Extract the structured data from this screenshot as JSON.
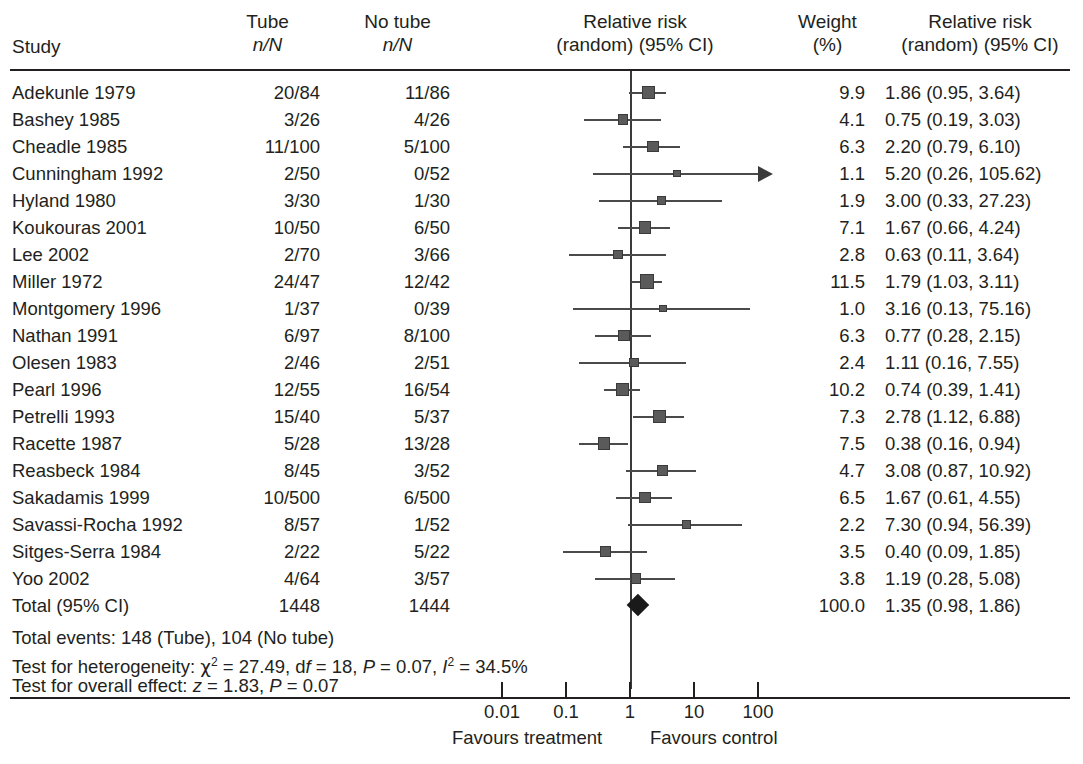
{
  "header": {
    "study_label": "Study",
    "tube": {
      "line1": "Tube",
      "line2": "n/N"
    },
    "no_tube": {
      "line1": "No tube",
      "line2": "n/N"
    },
    "plot": {
      "line1": "Relative risk",
      "line2": "(random) (95% CI)"
    },
    "weight": {
      "line1": "Weight",
      "line2": "(%)"
    },
    "rr": {
      "line1": "Relative risk",
      "line2": "(random) (95% CI)"
    }
  },
  "chart_data": {
    "type": "forest",
    "title": "Relative risk (random) (95% CI)",
    "xlabel": "",
    "ylabel": "",
    "xscale": "log",
    "xlim": [
      0.01,
      100
    ],
    "xticks": [
      "0.01",
      "0.1",
      "1",
      "10",
      "100"
    ],
    "xtick_values": [
      0.01,
      0.1,
      1,
      10,
      100
    ],
    "null_line": 1,
    "favours_left": "Favours treatment",
    "favours_right": "Favours control",
    "grid": false,
    "columns": [
      "Study",
      "Tube n/N",
      "No tube n/N",
      "Weight (%)",
      "Relative risk (random) (95% CI)"
    ],
    "rows": [
      {
        "study": "Adekunle 1979",
        "tube": "20/84",
        "no_tube": "11/86",
        "weight": "9.9",
        "weight_value": 9.9,
        "rr_text": "1.86 (0.95, 3.64)",
        "rr": 1.86,
        "lo": 0.95,
        "hi": 3.64,
        "arrow": false
      },
      {
        "study": "Bashey 1985",
        "tube": "3/26",
        "no_tube": "4/26",
        "weight": "4.1",
        "weight_value": 4.1,
        "rr_text": "0.75 (0.19, 3.03)",
        "rr": 0.75,
        "lo": 0.19,
        "hi": 3.03,
        "arrow": false
      },
      {
        "study": "Cheadle 1985",
        "tube": "11/100",
        "no_tube": "5/100",
        "weight": "6.3",
        "weight_value": 6.3,
        "rr_text": "2.20 (0.79, 6.10)",
        "rr": 2.2,
        "lo": 0.79,
        "hi": 6.1,
        "arrow": false
      },
      {
        "study": "Cunningham 1992",
        "tube": "2/50",
        "no_tube": "0/52",
        "weight": "1.1",
        "weight_value": 1.1,
        "rr_text": "5.20 (0.26, 105.62)",
        "rr": 5.2,
        "lo": 0.26,
        "hi": 105.62,
        "arrow": true
      },
      {
        "study": "Hyland 1980",
        "tube": "3/30",
        "no_tube": "1/30",
        "weight": "1.9",
        "weight_value": 1.9,
        "rr_text": "3.00 (0.33, 27.23)",
        "rr": 3.0,
        "lo": 0.33,
        "hi": 27.23,
        "arrow": false
      },
      {
        "study": "Koukouras 2001",
        "tube": "10/50",
        "no_tube": "6/50",
        "weight": "7.1",
        "weight_value": 7.1,
        "rr_text": "1.67 (0.66, 4.24)",
        "rr": 1.67,
        "lo": 0.66,
        "hi": 4.24,
        "arrow": false
      },
      {
        "study": "Lee 2002",
        "tube": "2/70",
        "no_tube": "3/66",
        "weight": "2.8",
        "weight_value": 2.8,
        "rr_text": "0.63 (0.11, 3.64)",
        "rr": 0.63,
        "lo": 0.11,
        "hi": 3.64,
        "arrow": false
      },
      {
        "study": "Miller 1972",
        "tube": "24/47",
        "no_tube": "12/42",
        "weight": "11.5",
        "weight_value": 11.5,
        "rr_text": "1.79 (1.03, 3.11)",
        "rr": 1.79,
        "lo": 1.03,
        "hi": 3.11,
        "arrow": false
      },
      {
        "study": "Montgomery 1996",
        "tube": "1/37",
        "no_tube": "0/39",
        "weight": "1.0",
        "weight_value": 1.0,
        "rr_text": "3.16 (0.13, 75.16)",
        "rr": 3.16,
        "lo": 0.13,
        "hi": 75.16,
        "arrow": false
      },
      {
        "study": "Nathan 1991",
        "tube": "6/97",
        "no_tube": "8/100",
        "weight": "6.3",
        "weight_value": 6.3,
        "rr_text": "0.77 (0.28, 2.15)",
        "rr": 0.77,
        "lo": 0.28,
        "hi": 2.15,
        "arrow": false
      },
      {
        "study": "Olesen 1983",
        "tube": "2/46",
        "no_tube": "2/51",
        "weight": "2.4",
        "weight_value": 2.4,
        "rr_text": "1.11 (0.16, 7.55)",
        "rr": 1.11,
        "lo": 0.16,
        "hi": 7.55,
        "arrow": false
      },
      {
        "study": "Pearl 1996",
        "tube": "12/55",
        "no_tube": "16/54",
        "weight": "10.2",
        "weight_value": 10.2,
        "rr_text": "0.74 (0.39, 1.41)",
        "rr": 0.74,
        "lo": 0.39,
        "hi": 1.41,
        "arrow": false
      },
      {
        "study": "Petrelli 1993",
        "tube": "15/40",
        "no_tube": "5/37",
        "weight": "7.3",
        "weight_value": 7.3,
        "rr_text": "2.78 (1.12, 6.88)",
        "rr": 2.78,
        "lo": 1.12,
        "hi": 6.88,
        "arrow": false
      },
      {
        "study": "Racette 1987",
        "tube": "5/28",
        "no_tube": "13/28",
        "weight": "7.5",
        "weight_value": 7.5,
        "rr_text": "0.38 (0.16, 0.94)",
        "rr": 0.38,
        "lo": 0.16,
        "hi": 0.94,
        "arrow": false
      },
      {
        "study": "Reasbeck 1984",
        "tube": "8/45",
        "no_tube": "3/52",
        "weight": "4.7",
        "weight_value": 4.7,
        "rr_text": "3.08 (0.87, 10.92)",
        "rr": 3.08,
        "lo": 0.87,
        "hi": 10.92,
        "arrow": false
      },
      {
        "study": "Sakadamis 1999",
        "tube": "10/500",
        "no_tube": "6/500",
        "weight": "6.5",
        "weight_value": 6.5,
        "rr_text": "1.67 (0.61, 4.55)",
        "rr": 1.67,
        "lo": 0.61,
        "hi": 4.55,
        "arrow": false
      },
      {
        "study": "Savassi-Rocha 1992",
        "tube": "8/57",
        "no_tube": "1/52",
        "weight": "2.2",
        "weight_value": 2.2,
        "rr_text": "7.30 (0.94, 56.39)",
        "rr": 7.3,
        "lo": 0.94,
        "hi": 56.39,
        "arrow": false
      },
      {
        "study": "Sitges-Serra 1984",
        "tube": "2/22",
        "no_tube": "5/22",
        "weight": "3.5",
        "weight_value": 3.5,
        "rr_text": "0.40 (0.09, 1.85)",
        "rr": 0.4,
        "lo": 0.09,
        "hi": 1.85,
        "arrow": false
      },
      {
        "study": "Yoo 2002",
        "tube": "4/64",
        "no_tube": "3/57",
        "weight": "3.8",
        "weight_value": 3.8,
        "rr_text": "1.19 (0.28, 5.08)",
        "rr": 1.19,
        "lo": 0.28,
        "hi": 5.08,
        "arrow": false
      }
    ],
    "total": {
      "study": "Total (95% CI)",
      "tube": "1448",
      "no_tube": "1444",
      "weight": "100.0",
      "weight_value": 100.0,
      "rr_text": "1.35 (0.98, 1.86)",
      "rr": 1.35,
      "lo": 0.98,
      "hi": 1.86
    }
  },
  "footer": {
    "total_events": "Total events: 148 (Tube), 104 (No tube)",
    "heterogeneity_prefix": "Test for heterogeneity: ",
    "heterogeneity_chi": "χ",
    "heterogeneity_mid": " = 27.49, d",
    "heterogeneity_f": "f",
    "heterogeneity_df": " = 18, ",
    "heterogeneity_P": "P",
    "heterogeneity_pval": " = 0.07, ",
    "heterogeneity_I": "I",
    "heterogeneity_isq": " = 34.5%",
    "overall_prefix": "Test for overall effect: ",
    "overall_z": "z",
    "overall_zval": " = 1.83, ",
    "overall_P": "P",
    "overall_pval": " = 0.07"
  },
  "colors": {
    "text": "#231f20",
    "rule": "#231f20",
    "marker": "#5a5a5a",
    "ci": "#4a4a4a",
    "diamond": "#1a1a1a"
  }
}
